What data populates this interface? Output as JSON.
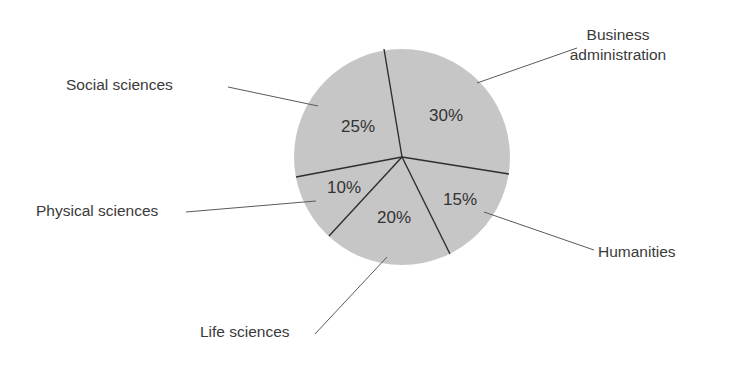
{
  "chart_data": {
    "type": "pie",
    "title": "",
    "categories": [
      "Business administration",
      "Humanities",
      "Life sciences",
      "Physical sciences",
      "Social sciences"
    ],
    "values": [
      30,
      15,
      20,
      10,
      25
    ],
    "value_labels": [
      "30%",
      "15%",
      "20%",
      "10%",
      "25%"
    ],
    "units": "%",
    "fill_color": "#c6c6c6",
    "divider_color": "#2e2e2e",
    "legend": "none (callout labels with leader lines)"
  },
  "pie": {
    "cx": 402,
    "cy": 157,
    "r": 108,
    "start_point": [
      384,
      49
    ]
  },
  "slices": [
    {
      "name": "Business administration",
      "pct": "30%",
      "pct_pos": [
        446,
        117
      ],
      "label_lines": [
        "Business",
        "administration"
      ],
      "label_pos": [
        618,
        40
      ],
      "label_anchor": "middle",
      "leader": [
        [
          477,
          83
        ],
        [
          577,
          48
        ]
      ]
    },
    {
      "name": "Humanities",
      "pct": "15%",
      "pct_pos": [
        460,
        201
      ],
      "label_lines": [
        "Humanities"
      ],
      "label_pos": [
        598,
        257
      ],
      "label_anchor": "start",
      "leader": [
        [
          484,
          212
        ],
        [
          594,
          250
        ]
      ]
    },
    {
      "name": "Life sciences",
      "pct": "20%",
      "pct_pos": [
        394,
        219
      ],
      "label_lines": [
        "Life sciences"
      ],
      "label_pos": [
        200,
        337
      ],
      "label_anchor": "start",
      "leader": [
        [
          387,
          257
        ],
        [
          315,
          334
        ]
      ]
    },
    {
      "name": "Physical sciences",
      "pct": "10%",
      "pct_pos": [
        344,
        189
      ],
      "label_lines": [
        "Physical sciences"
      ],
      "label_pos": [
        36,
        216
      ],
      "label_anchor": "start",
      "leader": [
        [
          316,
          201
        ],
        [
          186,
          212
        ]
      ]
    },
    {
      "name": "Social sciences",
      "pct": "25%",
      "pct_pos": [
        358,
        128
      ],
      "label_lines": [
        "Social sciences"
      ],
      "label_pos": [
        66,
        90
      ],
      "label_anchor": "start",
      "leader": [
        [
          318,
          106
        ],
        [
          228,
          87
        ]
      ]
    }
  ],
  "dividers": [
    [
      384,
      49
    ],
    [
      509,
      174
    ],
    [
      450,
      254
    ],
    [
      329,
      236
    ],
    [
      296,
      177
    ]
  ]
}
